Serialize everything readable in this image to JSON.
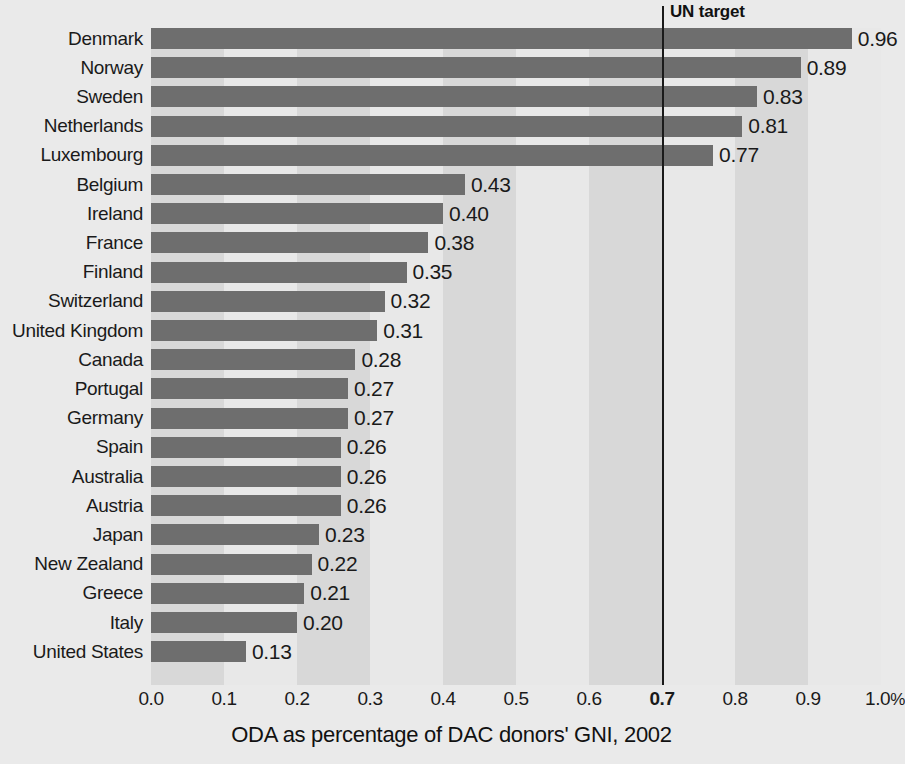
{
  "chart_data": {
    "type": "bar",
    "orientation": "horizontal",
    "title": "",
    "xlabel": "ODA as percentage of DAC donors' GNI, 2002",
    "ylabel": "",
    "xlim": [
      0.0,
      1.0
    ],
    "grid": false,
    "categories": [
      "Denmark",
      "Norway",
      "Sweden",
      "Netherlands",
      "Luxembourg",
      "Belgium",
      "Ireland",
      "France",
      "Finland",
      "Switzerland",
      "United Kingdom",
      "Canada",
      "Portugal",
      "Germany",
      "Spain",
      "Australia",
      "Austria",
      "Japan",
      "New Zealand",
      "Greece",
      "Italy",
      "United States"
    ],
    "values": [
      0.96,
      0.89,
      0.83,
      0.81,
      0.77,
      0.43,
      0.4,
      0.38,
      0.35,
      0.32,
      0.31,
      0.28,
      0.27,
      0.27,
      0.26,
      0.26,
      0.26,
      0.23,
      0.22,
      0.21,
      0.2,
      0.13
    ],
    "value_labels": [
      "0.96",
      "0.89",
      "0.83",
      "0.81",
      "0.77",
      "0.43",
      "0.40",
      "0.38",
      "0.35",
      "0.32",
      "0.31",
      "0.28",
      "0.27",
      "0.27",
      "0.26",
      "0.26",
      "0.26",
      "0.23",
      "0.22",
      "0.21",
      "0.20",
      "0.13"
    ],
    "xticks": [
      0.0,
      0.1,
      0.2,
      0.3,
      0.4,
      0.5,
      0.6,
      0.7,
      0.8,
      0.9,
      1.0
    ],
    "xtick_labels": [
      "0.0",
      "0.1",
      "0.2",
      "0.3",
      "0.4",
      "0.5",
      "0.6",
      "0.7",
      "0.8",
      "0.9",
      "1.0"
    ],
    "xtick_unit_suffix": "%",
    "emphasized_xtick": "0.7",
    "annotations": [
      {
        "name": "un-target",
        "label": "UN target",
        "value": 0.7
      }
    ],
    "colors": {
      "bar": "#6e6e6e",
      "background": "#eaeaea",
      "band_dark": "#d8d8d8",
      "band_light": "#e8e8e8",
      "target_line": "#1a1a1a",
      "text": "#1a1a1a"
    }
  }
}
